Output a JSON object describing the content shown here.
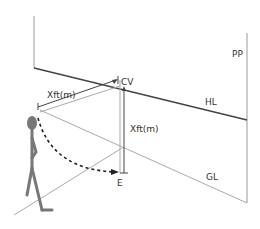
{
  "diagram": {
    "labels": {
      "pp": "PP",
      "hl": "HL",
      "gl": "GL",
      "cv": "CV",
      "e": "E",
      "distance_horizontal": "Xft(m)",
      "distance_vertical": "Xft(m)"
    },
    "colors": {
      "dark_line": "#444444",
      "light_line": "#aaaaaa",
      "figure": "#777777",
      "text": "#333333"
    }
  }
}
